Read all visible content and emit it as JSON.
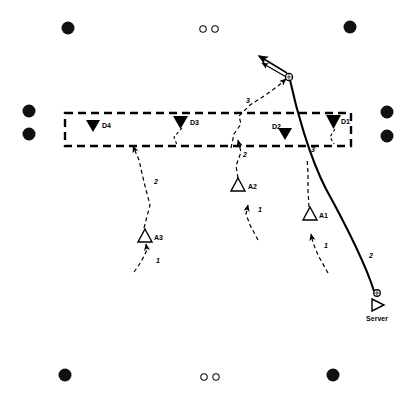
{
  "diagram": {
    "court": {
      "width": 419,
      "height": 400,
      "background_color": "#ffffff",
      "line_color": "#000000"
    },
    "net_zone": {
      "name": "net-zone",
      "style": "dashed-rectangle",
      "x": 65,
      "y": 113,
      "width": 286,
      "height": 33
    },
    "defenders": [
      {
        "id": "D4",
        "label": "D4",
        "marker": "filled-down-triangle",
        "x": 93,
        "y": 125,
        "label_x": 101,
        "label_y": 128
      },
      {
        "id": "D3",
        "label": "D3",
        "marker": "filled-down-triangle",
        "x": 180,
        "y": 122,
        "label_x": 189,
        "label_y": 125
      },
      {
        "id": "D2",
        "label": "D2",
        "marker": "filled-down-triangle",
        "x": 285,
        "y": 133,
        "label_x": 273,
        "label_y": 128
      },
      {
        "id": "D1",
        "label": "D1",
        "marker": "filled-down-triangle",
        "x": 333,
        "y": 121,
        "label_x": 339,
        "label_y": 124
      }
    ],
    "attackers": [
      {
        "id": "A1",
        "label": "A1",
        "marker": "hollow-up-triangle",
        "x": 310,
        "y": 215,
        "label_x": 320,
        "label_y": 216
      },
      {
        "id": "A2",
        "label": "A2",
        "marker": "hollow-up-triangle",
        "x": 239,
        "y": 186,
        "label_x": 249,
        "label_y": 188
      },
      {
        "id": "A3",
        "label": "A3",
        "marker": "hollow-up-triangle",
        "x": 145,
        "y": 237,
        "label_x": 155,
        "label_y": 238
      }
    ],
    "server": {
      "id": "Server",
      "label": "Server",
      "marker": "hollow-right-triangle",
      "x": 377,
      "y": 303,
      "label_x": 377,
      "label_y": 319,
      "ball_x": 377,
      "ball_y": 294
    },
    "ball_contact": {
      "name": "set-contact-ball",
      "x": 289,
      "y": 77
    },
    "corner_markers": [
      {
        "name": "corner-dot-top-left",
        "x": 68,
        "y": 28,
        "r": 6,
        "fill": "solid"
      },
      {
        "name": "corner-dot-top-right",
        "x": 350,
        "y": 27,
        "r": 6,
        "fill": "solid"
      },
      {
        "name": "corner-dot-bottom-left",
        "x": 65,
        "y": 375,
        "r": 6,
        "fill": "solid"
      },
      {
        "name": "corner-dot-bottom-right",
        "x": 333,
        "y": 375,
        "r": 6,
        "fill": "solid"
      },
      {
        "name": "side-dot-left-upper",
        "x": 29,
        "y": 111,
        "r": 6,
        "fill": "solid"
      },
      {
        "name": "side-dot-left-lower",
        "x": 29,
        "y": 134,
        "r": 6,
        "fill": "solid"
      },
      {
        "name": "side-dot-right-upper",
        "x": 387,
        "y": 112,
        "r": 6,
        "fill": "solid"
      },
      {
        "name": "side-dot-right-lower",
        "x": 387,
        "y": 136,
        "r": 6,
        "fill": "solid"
      },
      {
        "name": "center-dot-top-left",
        "x": 203,
        "y": 29,
        "r": 3,
        "fill": "hollow"
      },
      {
        "name": "center-dot-top-right",
        "x": 215,
        "y": 29,
        "r": 3,
        "fill": "hollow"
      },
      {
        "name": "center-dot-bottom-left",
        "x": 204,
        "y": 377,
        "r": 3,
        "fill": "hollow"
      },
      {
        "name": "center-dot-bottom-right",
        "x": 216,
        "y": 377,
        "r": 3,
        "fill": "hollow"
      }
    ],
    "movement_paths": [
      {
        "name": "path-a3-step1",
        "style": "dashed",
        "step_label": "1",
        "label_x": 157,
        "label_y": 262,
        "d": "M 134,272 L 141,262 L 147,250 L 146,244"
      },
      {
        "name": "path-a3-step2",
        "style": "dashed",
        "step_label": "2",
        "label_x": 153,
        "label_y": 182,
        "d": "M 144,228 L 150,205 L 144,182 L 139,160 L 133,146"
      },
      {
        "name": "path-a2-step1",
        "style": "dashed",
        "step_label": "1",
        "label_x": 256,
        "label_y": 210,
        "d": "M 256,237 L 250,225 L 246,214 L 248,206"
      },
      {
        "name": "path-a2-step2",
        "style": "dashed",
        "step_label": "2",
        "label_x": 244,
        "label_y": 155,
        "d": "M 238,178 L 236,165 L 240,150 L 238,140"
      },
      {
        "name": "path-a1-step1",
        "style": "dashed",
        "step_label": "1",
        "label_x": 323,
        "label_y": 246,
        "d": "M 325,269 L 318,256 L 312,242 L 311,234"
      },
      {
        "name": "path-a1-step3-set",
        "style": "dashed",
        "step_label": "3",
        "label_x": 247,
        "label_y": 101,
        "d": "M 231,147 L 234,133 L 241,123 L 239,115 L 248,105 L 262,97 L 277,87 L 287,79"
      },
      {
        "name": "path-d1-approach",
        "style": "dashed",
        "step_label": "",
        "label_x": 0,
        "label_y": 0,
        "d": "M 334,130 L 330,137 L 334,143"
      },
      {
        "name": "path-d3-approach",
        "style": "dashed",
        "step_label": "",
        "label_x": 0,
        "label_y": 0,
        "d": "M 181,128 L 175,137 L 177,144"
      },
      {
        "name": "path-serve-trajectory",
        "style": "solid",
        "step_label": "2",
        "label_x": 370,
        "label_y": 256,
        "d": "M 374,291 C 365,265 345,225 320,180 C 305,148 295,105 290,80"
      },
      {
        "name": "path-attack-hit",
        "style": "solid-double-arrow",
        "step_label": "",
        "label_x": 0,
        "label_y": 0,
        "d": "M 287,75 L 258,58"
      }
    ],
    "step_numbers_standalone": [
      {
        "text": "3",
        "x": 312,
        "y": 150
      }
    ]
  }
}
